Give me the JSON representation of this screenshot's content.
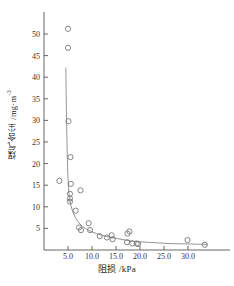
{
  "chart_data": {
    "type": "scatter",
    "title": "",
    "xlabel": "阻损 /kPa",
    "ylabel_main": "煤气含尘 /mg·m",
    "ylabel_sup": "-3",
    "xlim": [
      0,
      35
    ],
    "ylim": [
      0,
      53
    ],
    "xticks": [
      "5.0",
      "10.0",
      "15.0",
      "20.0",
      "25.0",
      "30.0"
    ],
    "xtick_values": [
      5,
      10,
      15,
      20,
      25,
      30
    ],
    "yticks": [
      "5",
      "10",
      "15",
      "20",
      "25",
      "30",
      "35",
      "40",
      "45",
      "50"
    ],
    "ytick_values": [
      5,
      10,
      15,
      20,
      25,
      30,
      35,
      40,
      45,
      50
    ],
    "grid": false,
    "legend": null,
    "marker": "open-circle",
    "marker_color": "#777777",
    "line_color": "#888888",
    "points": [
      {
        "x": 3.2,
        "y": 16.0
      },
      {
        "x": 5.0,
        "y": 51.2
      },
      {
        "x": 5.0,
        "y": 46.8
      },
      {
        "x": 5.1,
        "y": 29.8
      },
      {
        "x": 5.5,
        "y": 21.5
      },
      {
        "x": 5.6,
        "y": 15.3
      },
      {
        "x": 5.4,
        "y": 13.0
      },
      {
        "x": 5.4,
        "y": 11.9
      },
      {
        "x": 5.4,
        "y": 11.2
      },
      {
        "x": 6.6,
        "y": 9.1
      },
      {
        "x": 7.6,
        "y": 13.8
      },
      {
        "x": 7.3,
        "y": 5.2
      },
      {
        "x": 7.7,
        "y": 4.6
      },
      {
        "x": 9.3,
        "y": 6.2
      },
      {
        "x": 9.6,
        "y": 4.6
      },
      {
        "x": 11.6,
        "y": 3.2
      },
      {
        "x": 13.1,
        "y": 2.9
      },
      {
        "x": 14.1,
        "y": 3.4
      },
      {
        "x": 14.3,
        "y": 2.5
      },
      {
        "x": 17.4,
        "y": 3.8
      },
      {
        "x": 17.8,
        "y": 4.3
      },
      {
        "x": 17.3,
        "y": 1.8
      },
      {
        "x": 18.4,
        "y": 1.5
      },
      {
        "x": 19.3,
        "y": 1.5
      },
      {
        "x": 19.6,
        "y": 1.4
      },
      {
        "x": 29.9,
        "y": 2.3
      },
      {
        "x": 33.5,
        "y": 1.2
      }
    ],
    "fit_curve": {
      "label": "fitted-curve",
      "points": [
        {
          "x": 4.55,
          "y": 42.2
        },
        {
          "x": 4.7,
          "y": 30.0
        },
        {
          "x": 4.9,
          "y": 20.0
        },
        {
          "x": 5.1,
          "y": 14.5
        },
        {
          "x": 5.4,
          "y": 11.5
        },
        {
          "x": 5.9,
          "y": 9.2
        },
        {
          "x": 6.6,
          "y": 7.4
        },
        {
          "x": 7.5,
          "y": 6.0
        },
        {
          "x": 8.6,
          "y": 5.0
        },
        {
          "x": 10.0,
          "y": 4.2
        },
        {
          "x": 11.8,
          "y": 3.5
        },
        {
          "x": 13.5,
          "y": 3.0
        },
        {
          "x": 15.5,
          "y": 2.6
        },
        {
          "x": 17.5,
          "y": 2.2
        },
        {
          "x": 20.0,
          "y": 1.9
        },
        {
          "x": 23.0,
          "y": 1.7
        },
        {
          "x": 26.0,
          "y": 1.5
        },
        {
          "x": 30.0,
          "y": 1.4
        },
        {
          "x": 34.0,
          "y": 1.3
        }
      ]
    }
  }
}
